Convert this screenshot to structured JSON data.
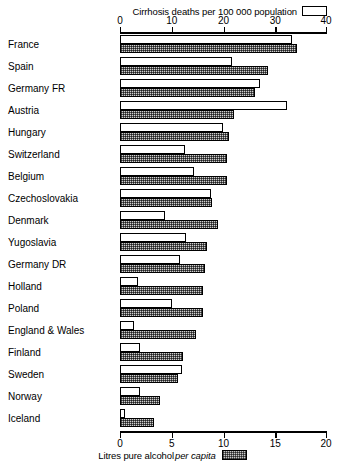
{
  "chart_data": {
    "type": "bar",
    "orientation": "horizontal",
    "title": "",
    "top_caption": "Cirrhosis deaths per 100 000 population",
    "bottom_caption_pre": "Litres pure alcohol",
    "bottom_caption_italic": "per capita",
    "categories": [
      "France",
      "Spain",
      "Germany FR",
      "Austria",
      "Hungary",
      "Switzerland",
      "Belgium",
      "Czechoslovakia",
      "Denmark",
      "Yugoslavia",
      "Germany DR",
      "Holland",
      "Poland",
      "England & Wales",
      "Finland",
      "Sweden",
      "Norway",
      "Iceland"
    ],
    "series": [
      {
        "name": "Cirrhosis deaths per 100 000 population",
        "key": "deaths",
        "axis": "top",
        "fill": "white",
        "values": [
          33.3,
          21.6,
          27.0,
          32.2,
          19.9,
          12.5,
          14.3,
          17.6,
          8.7,
          12.7,
          11.6,
          3.5,
          10.0,
          2.7,
          3.9,
          12.0,
          3.9,
          1.0
        ]
      },
      {
        "name": "Litres pure alcohol per capita",
        "key": "alcohol",
        "axis": "bottom",
        "fill": "hatched",
        "values": [
          17.1,
          14.3,
          13.0,
          11.0,
          10.5,
          10.3,
          10.3,
          8.9,
          9.5,
          8.4,
          8.2,
          8.0,
          8.0,
          7.3,
          6.1,
          5.6,
          3.9,
          3.3
        ]
      }
    ],
    "top_axis": {
      "label": "Cirrhosis deaths per 100 000 population",
      "ticks": [
        0,
        10,
        20,
        30,
        40
      ],
      "range": [
        0,
        40
      ],
      "position": "top"
    },
    "bottom_axis": {
      "label": "Litres pure alcohol per capita",
      "ticks": [
        0,
        5,
        10,
        15,
        20
      ],
      "range": [
        0,
        20
      ],
      "position": "bottom"
    },
    "grid": false,
    "legend": {
      "position": "inline-with-axis-captions",
      "entries": [
        {
          "label": "Cirrhosis deaths per 100 000 population",
          "swatch": "white"
        },
        {
          "label": "Litres pure alcohol per capita",
          "swatch": "hatched"
        }
      ]
    }
  }
}
